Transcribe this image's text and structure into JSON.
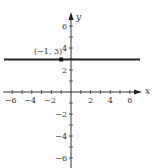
{
  "chart_data": {
    "type": "line",
    "title": "",
    "xlabel": "x",
    "ylabel": "y",
    "xlim": [
      -7,
      7
    ],
    "ylim": [
      -7,
      7
    ],
    "grid": false,
    "x_ticks": [
      -6,
      -4,
      -2,
      2,
      4,
      6
    ],
    "y_ticks": [
      -6,
      -4,
      -2,
      2,
      4,
      6
    ],
    "x_tick_labels": [
      "−6",
      "−4",
      "−2",
      "2",
      "4",
      "6"
    ],
    "y_tick_labels": [
      "−6",
      "−4",
      "−2",
      "2",
      "4",
      "6"
    ],
    "series": [
      {
        "name": "y = 3",
        "kind": "horizontal-line",
        "x": [
          -7,
          7
        ],
        "y": [
          3,
          3
        ]
      }
    ],
    "annotations": [
      {
        "label": "(−1, 3)",
        "x": -1,
        "y": 3,
        "marker": "filled-square"
      }
    ]
  },
  "labels": {
    "x_axis": "x",
    "y_axis": "y",
    "point": "(−1, 3)"
  }
}
